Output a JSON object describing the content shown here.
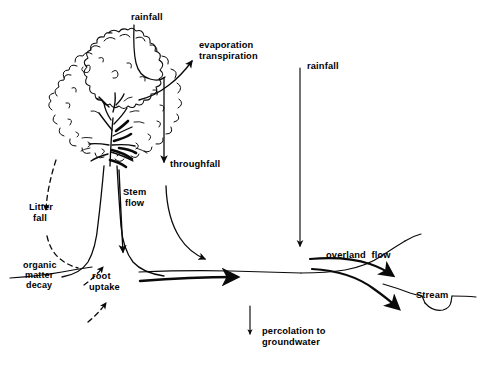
{
  "diagram": {
    "style": {
      "ink": "#0a0a0a",
      "background": "#ffffff"
    },
    "labels": [
      {
        "name": "rainfall-canopy",
        "text": "rainfall",
        "x": 131,
        "y": 12
      },
      {
        "name": "evaporation",
        "text": "evaporation",
        "x": 199,
        "y": 41
      },
      {
        "name": "transpiration",
        "text": "transpiration",
        "x": 199,
        "y": 52
      },
      {
        "name": "rainfall-open",
        "text": "rainfall",
        "x": 307,
        "y": 62
      },
      {
        "name": "throughfall",
        "text": "throughfall",
        "x": 170,
        "y": 160
      },
      {
        "name": "stem-flow-1",
        "text": "Stem",
        "x": 123,
        "y": 188
      },
      {
        "name": "stem-flow-2",
        "text": "flow",
        "x": 125,
        "y": 199
      },
      {
        "name": "litter-fall-1",
        "text": "Litter",
        "x": 29,
        "y": 203
      },
      {
        "name": "litter-fall-2",
        "text": "fall",
        "x": 33,
        "y": 214
      },
      {
        "name": "organic-matter-1",
        "text": "organic",
        "x": 23,
        "y": 261
      },
      {
        "name": "organic-matter-2",
        "text": "matter",
        "x": 25,
        "y": 271
      },
      {
        "name": "organic-matter-3",
        "text": "decay",
        "x": 26,
        "y": 281
      },
      {
        "name": "root-uptake-1",
        "text": "root",
        "x": 92,
        "y": 272
      },
      {
        "name": "root-uptake-2",
        "text": "uptake",
        "x": 89,
        "y": 283
      },
      {
        "name": "overland-flow",
        "text": "overland  flow",
        "x": 326,
        "y": 251
      },
      {
        "name": "stream",
        "text": "Stream",
        "x": 416,
        "y": 291
      },
      {
        "name": "percolation-1",
        "text": "percolation to",
        "x": 262,
        "y": 327
      },
      {
        "name": "percolation-2",
        "text": "groundwater",
        "x": 262,
        "y": 338
      }
    ],
    "flows": [
      {
        "name": "rainfall-canopy-flow",
        "label": "rainfall",
        "kind": "solid-arrow",
        "direction": "down"
      },
      {
        "name": "evapotranspiration-flow",
        "label": "evaporation transpiration",
        "kind": "solid-arrow",
        "direction": "up-right"
      },
      {
        "name": "rainfall-open-flow",
        "label": "rainfall",
        "kind": "solid-arrow",
        "direction": "down"
      },
      {
        "name": "throughfall-flow",
        "label": "throughfall",
        "kind": "solid-arrow",
        "direction": "down"
      },
      {
        "name": "stem-flow-flow",
        "label": "Stem flow",
        "kind": "solid-arrow",
        "direction": "down"
      },
      {
        "name": "litter-fall-flow",
        "label": "Litter fall",
        "kind": "dashed-arrow",
        "direction": "down"
      },
      {
        "name": "root-uptake-flow",
        "label": "root uptake",
        "kind": "dashed-arrow",
        "direction": "up"
      },
      {
        "name": "subsurface-flow",
        "label": "",
        "kind": "solid-arrow",
        "direction": "right"
      },
      {
        "name": "overland-flow-flow",
        "label": "overland flow",
        "kind": "solid-arrow",
        "direction": "down-right"
      },
      {
        "name": "percolation-flow",
        "label": "percolation to groundwater",
        "kind": "solid-arrow",
        "direction": "down"
      }
    ],
    "features": [
      {
        "name": "tree",
        "kind": "tree-sketch"
      },
      {
        "name": "ground-line",
        "kind": "terrain-profile"
      },
      {
        "name": "stream-channel",
        "kind": "channel-notch"
      }
    ]
  }
}
